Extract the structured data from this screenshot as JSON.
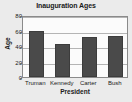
{
  "chart_data": {
    "type": "bar",
    "title": "Inauguration Ages",
    "xlabel": "President",
    "ylabel": "Age",
    "categories": [
      "Truman",
      "Kennedy",
      "Carter",
      "Bush"
    ],
    "values": [
      60,
      43,
      52,
      53
    ],
    "ylim": [
      0,
      80
    ],
    "yticks": [
      0,
      20,
      40,
      60,
      80
    ],
    "ytick_labels": [
      "0",
      "20",
      "40",
      "60",
      "80"
    ],
    "grid": true,
    "grid_axis": "y",
    "legend": null,
    "bar_color": "#4a4a4a",
    "bar_edge_color": "#3c3c3c",
    "plot_background": "#fbfbfb",
    "figure_background": "#ebebeb",
    "axis_color": "#8a8a8a",
    "gridline_color": "#b4b4b4",
    "text_color": "#1a1a1a"
  }
}
